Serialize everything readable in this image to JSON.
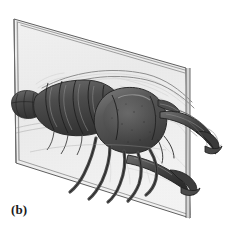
{
  "figure": {
    "panel_label": "(b)",
    "caption_concept": "bilateral symmetry plane through a crayfish",
    "background_color": "#ffffff",
    "plane": {
      "name": "sagittal-symmetry-plane",
      "fill_color": "#e6e6e6",
      "edge_color": "#6e6e6e",
      "opacity": 0.72,
      "corners": {
        "top_left": [
          14,
          19
        ],
        "top_right": [
          186,
          68
        ],
        "bottom_right": [
          190,
          218
        ],
        "bottom_left": [
          16,
          163
        ]
      }
    },
    "organism": {
      "near_half_color": "#4a4a4a",
      "far_half_color": "#b4b4b4",
      "outline_color": "#2e2e2e",
      "parts": [
        {
          "name": "tail-fan",
          "label": "telson and uropods"
        },
        {
          "name": "abdomen",
          "label": "segmented abdomen"
        },
        {
          "name": "carapace",
          "label": "cephalothorax carapace"
        },
        {
          "name": "rostrum",
          "label": "rostrum"
        },
        {
          "name": "antenna-upper",
          "label": "antenna"
        },
        {
          "name": "antenna-lower",
          "label": "antenna"
        },
        {
          "name": "cheliped-near",
          "label": "near cheliped (claw)"
        },
        {
          "name": "cheliped-far",
          "label": "far cheliped (claw)"
        },
        {
          "name": "walking-legs-near",
          "label": "near walking legs"
        },
        {
          "name": "walking-legs-far",
          "label": "far walking legs"
        }
      ]
    }
  }
}
